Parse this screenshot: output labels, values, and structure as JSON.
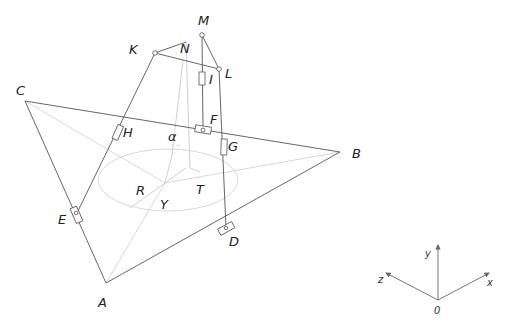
{
  "diagram": {
    "type": "isometric mechanism / spatial structure sketch",
    "points": {
      "M": "M",
      "N": "N",
      "K": "K",
      "L": "L",
      "I": "I",
      "C": "C",
      "H": "H",
      "F": "F",
      "G": "G",
      "B": "B",
      "E": "E",
      "D": "D",
      "A": "A",
      "R": "R",
      "T": "T",
      "Y": "Y"
    },
    "angle_label": "α",
    "axes": {
      "x": "x",
      "y": "y",
      "z": "z",
      "origin": "0"
    }
  }
}
